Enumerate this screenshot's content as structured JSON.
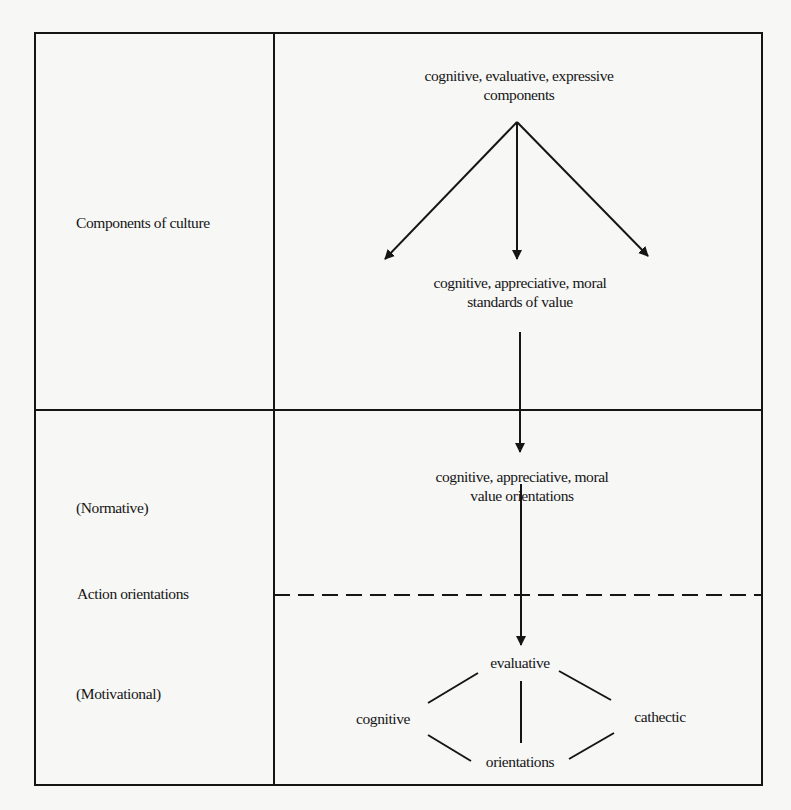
{
  "diagram": {
    "left_column": {
      "components_of_culture": "Components of culture",
      "normative": "(Normative)",
      "action_orientations": "Action orientations",
      "motivational": "(Motivational)"
    },
    "right_column": {
      "components_line1": "cognitive, evaluative, expressive",
      "components_line2": "components",
      "standards_line1": "cognitive, appreciative, moral",
      "standards_line2": "standards of value",
      "value_orient_line1": "cognitive, appreciative, moral",
      "value_orient_line2": "value orientations",
      "evaluative": "evaluative",
      "cognitive": "cognitive",
      "cathectic": "cathectic",
      "orientations": "orientations"
    },
    "colors": {
      "background": "#f7f7f5",
      "ink": "#151515"
    }
  }
}
